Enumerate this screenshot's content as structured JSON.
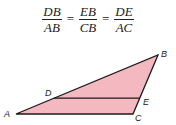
{
  "formula": {
    "terms": [
      {
        "num": "DB",
        "den": "AB"
      },
      {
        "num": "EB",
        "den": "CB"
      },
      {
        "num": "DE",
        "den": "AC"
      }
    ],
    "equals": "="
  },
  "figure": {
    "fill_color": "#f4b9c0",
    "stroke_color": "#1a1a1a",
    "vertices": {
      "A": {
        "label": "A"
      },
      "B": {
        "label": "B"
      },
      "C": {
        "label": "C"
      },
      "D": {
        "label": "D"
      },
      "E": {
        "label": "E"
      }
    }
  }
}
